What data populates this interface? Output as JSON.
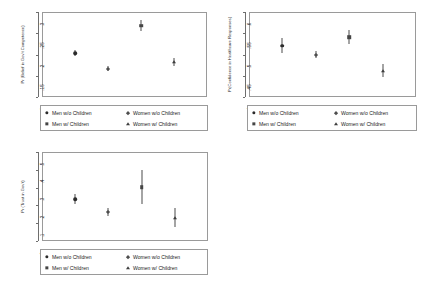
{
  "figure": {
    "background_color": "#ffffff",
    "frame_color": "#9a9a9a",
    "groups": [
      {
        "key": "men_wo_children",
        "label": "Men w/o Children",
        "marker": "circle",
        "color": "#2b2b2b"
      },
      {
        "key": "women_wo_children",
        "label": "Women w/o Children",
        "marker": "diamond",
        "color": "#4e4e4e"
      },
      {
        "key": "men_w_children",
        "label": "Men w/ Children",
        "marker": "square",
        "color": "#454545"
      },
      {
        "key": "women_w_children",
        "label": "Women w/ Children",
        "marker": "triangle",
        "color": "#3d3d3d"
      }
    ]
  },
  "chart_data": [
    {
      "id": "panel-competence",
      "type": "scatter",
      "title": "",
      "xlabel": "",
      "ylabel": "Pr (Belief in Gov't Competence)",
      "ylim": [
        0.1,
        0.3
      ],
      "yticks": [
        0.1,
        0.15,
        0.2,
        0.25,
        0.3
      ],
      "ytick_labels": [
        ".1",
        ".15",
        ".2",
        ".25",
        ".3"
      ],
      "grid": false,
      "legend_position": "below",
      "categories": [
        "Men w/o Children",
        "Women w/o Children",
        "Men w/ Children",
        "Women w/ Children"
      ],
      "x": [
        1,
        2,
        3,
        4
      ],
      "values": [
        0.203,
        0.167,
        0.268,
        0.182
      ],
      "ci_low": [
        0.196,
        0.162,
        0.256,
        0.173
      ],
      "ci_high": [
        0.211,
        0.173,
        0.281,
        0.192
      ],
      "markers": [
        "circle",
        "diamond",
        "square",
        "triangle"
      ]
    },
    {
      "id": "panel-healthcare",
      "type": "scatter",
      "title": "",
      "xlabel": "",
      "ylabel": "Pr(Confidence in Healthcare Responses)",
      "ylim": [
        0.4,
        0.6
      ],
      "yticks": [
        0.4,
        0.45,
        0.5,
        0.55,
        0.6
      ],
      "ytick_labels": [
        ".4",
        ".45",
        ".5",
        ".55",
        ".6"
      ],
      "grid": false,
      "legend_position": "below",
      "categories": [
        "Men w/o Children",
        "Women w/o Children",
        "Men w/ Children",
        "Women w/ Children"
      ],
      "x": [
        1,
        2,
        3,
        4
      ],
      "values": [
        0.521,
        0.499,
        0.541,
        0.462
      ],
      "ci_low": [
        0.504,
        0.491,
        0.525,
        0.447
      ],
      "ci_high": [
        0.539,
        0.508,
        0.558,
        0.477
      ],
      "markers": [
        "circle",
        "diamond",
        "square",
        "triangle"
      ]
    },
    {
      "id": "panel-trust",
      "type": "scatter",
      "title": "",
      "xlabel": "",
      "ylabel": "Pr (Trust in Gov't)",
      "ylim": [
        0.0,
        0.5
      ],
      "yticks": [
        0.0,
        0.1,
        0.2,
        0.3,
        0.4,
        0.5
      ],
      "ytick_labels": [
        "0",
        ".1",
        ".2",
        ".3",
        ".4",
        ".5"
      ],
      "grid": false,
      "legend_position": "below",
      "categories": [
        "Men w/o Children",
        "Women w/o Children",
        "Men w/ Children",
        "Women w/ Children"
      ],
      "x": [
        1,
        2,
        3,
        4
      ],
      "values": [
        0.235,
        0.162,
        0.303,
        0.132
      ],
      "ci_low": [
        0.207,
        0.139,
        0.205,
        0.079
      ],
      "ci_high": [
        0.263,
        0.186,
        0.401,
        0.186
      ],
      "markers": [
        "circle",
        "diamond",
        "square",
        "triangle"
      ]
    }
  ]
}
